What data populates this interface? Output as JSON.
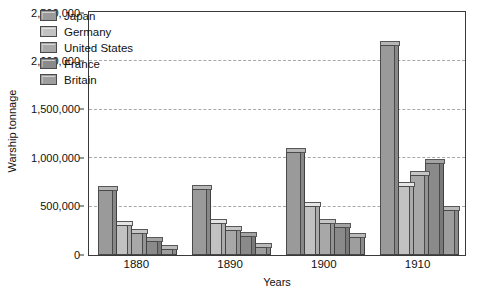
{
  "chart_data": {
    "type": "bar",
    "title": "",
    "xlabel": "Years",
    "ylabel": "Warship tonnage",
    "categories": [
      "1880",
      "1890",
      "1900",
      "1910"
    ],
    "ylim": [
      0,
      2500000
    ],
    "yticks": [
      0,
      500000,
      1000000,
      1500000,
      2000000,
      2500000
    ],
    "ytick_labels": [
      "0",
      "500,000",
      "1,000,000",
      "1,500,000",
      "2,000,000",
      "2,500,000"
    ],
    "grid": "horizontal-dashed",
    "legend_position": "top-left-inside",
    "series": [
      {
        "name": "Japan",
        "color": "#9a9a9a",
        "values": [
          670000,
          680000,
          1060000,
          2170000
        ]
      },
      {
        "name": "Germany",
        "color": "#c2c2c2",
        "values": [
          310000,
          330000,
          510000,
          710000
        ]
      },
      {
        "name": "United States",
        "color": "#a8a8a8",
        "values": [
          230000,
          260000,
          330000,
          830000
        ]
      },
      {
        "name": "France",
        "color": "#8a8a8a",
        "values": [
          140000,
          200000,
          290000,
          950000
        ]
      },
      {
        "name": "Britain",
        "color": "#9e9e9e",
        "values": [
          60000,
          80000,
          190000,
          470000
        ]
      }
    ]
  }
}
